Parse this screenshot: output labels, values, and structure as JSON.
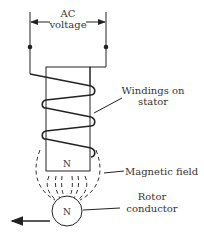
{
  "diagram": {
    "labels": {
      "ac_line1": "AC",
      "ac_line2": "voltage",
      "windings_line1": "Windings on",
      "windings_line2": "stator",
      "field": "Magnetic field",
      "rotor_line1": "Rotor",
      "rotor_line2": "conductor",
      "stator_pole": "N",
      "rotor_pole": "N"
    },
    "colors": {
      "stroke": "#222222",
      "text": "#333333",
      "background": "#ffffff"
    }
  }
}
